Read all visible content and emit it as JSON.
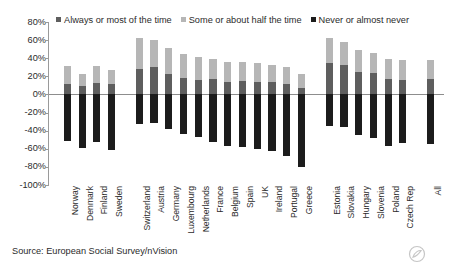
{
  "chart_data": {
    "type": "bar",
    "title": "",
    "subtitle": "",
    "xlabel": "",
    "ylabel": "",
    "ylim": [
      -100,
      80
    ],
    "ytick_labels": [
      "80%",
      "60%",
      "40%",
      "20%",
      "0%",
      "-20%",
      "-40%",
      "-60%",
      "-80%",
      "-100%"
    ],
    "ytick_values": [
      80,
      60,
      40,
      20,
      0,
      -20,
      -40,
      -60,
      -80,
      -100
    ],
    "grid": false,
    "stacked": true,
    "diverging": true,
    "legend_position": "top",
    "orientation": "vertical",
    "categories": [
      "Norway",
      "Denmark",
      "Finland",
      "Sweden",
      "Switzerland",
      "Austria",
      "Germany",
      "Luxembourg",
      "Netherlands",
      "France",
      "Belgium",
      "Spain",
      "UK",
      "Ireland",
      "Portugal",
      "Greece",
      "Estonia",
      "Slovakia",
      "Hungary",
      "Slovenia",
      "Poland",
      "Czech Rep",
      "All"
    ],
    "group_breaks": [
      4,
      16,
      22
    ],
    "series": [
      {
        "name": "Always or most of the time",
        "color": "#5e5e5e",
        "direction": "up",
        "values": [
          12,
          9,
          13,
          11,
          28,
          30,
          23,
          18,
          16,
          17,
          14,
          15,
          14,
          14,
          12,
          7,
          35,
          33,
          25,
          24,
          17,
          16,
          17
        ]
      },
      {
        "name": "Some or about half the time",
        "color": "#b6b6b6",
        "direction": "up",
        "values": [
          19,
          14,
          18,
          16,
          34,
          30,
          28,
          27,
          25,
          22,
          22,
          21,
          21,
          19,
          18,
          16,
          27,
          25,
          24,
          22,
          22,
          22,
          21
        ]
      },
      {
        "name": "Never or almost never",
        "color": "#1c1c1c",
        "direction": "down",
        "values": [
          -51,
          -59,
          -53,
          -61,
          -33,
          -31,
          -38,
          -44,
          -47,
          -53,
          -57,
          -58,
          -60,
          -62,
          -68,
          -80,
          -35,
          -36,
          -45,
          -48,
          -57,
          -54,
          -55
        ]
      }
    ],
    "legend": [
      {
        "label": "Always or most of the time",
        "color": "#5e5e5e"
      },
      {
        "label": "Some or about half the time",
        "color": "#b6b6b6"
      },
      {
        "label": "Never or almost never",
        "color": "#1c1c1c"
      }
    ]
  },
  "source_note": "Source: European Social Survey/nVision",
  "watermark": {
    "name": "circular-logo-watermark"
  }
}
